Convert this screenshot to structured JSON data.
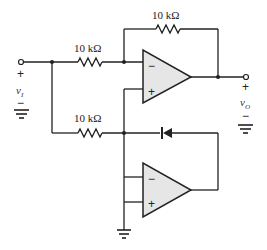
{
  "diagram": {
    "type": "precision rectifier circuit schematic",
    "components": {
      "r_feedback_top": {
        "label": "10 kΩ"
      },
      "r_input_top": {
        "label": "10 kΩ"
      },
      "r_input_bottom": {
        "label": "10 kΩ"
      },
      "opamp_top": {
        "inverting": "−",
        "noninverting": "+"
      },
      "opamp_bottom": {
        "inverting": "−",
        "noninverting": "+"
      },
      "diode": {
        "symbol": "diode-icon"
      }
    },
    "terminals": {
      "input": {
        "plus": "+",
        "name": "v",
        "sub": "I",
        "minus": "−"
      },
      "output": {
        "plus": "+",
        "name": "v",
        "sub": "O",
        "minus": "−"
      }
    },
    "colors": {
      "wire": "#222222",
      "opamp_fill": "#e6e6e6"
    }
  }
}
